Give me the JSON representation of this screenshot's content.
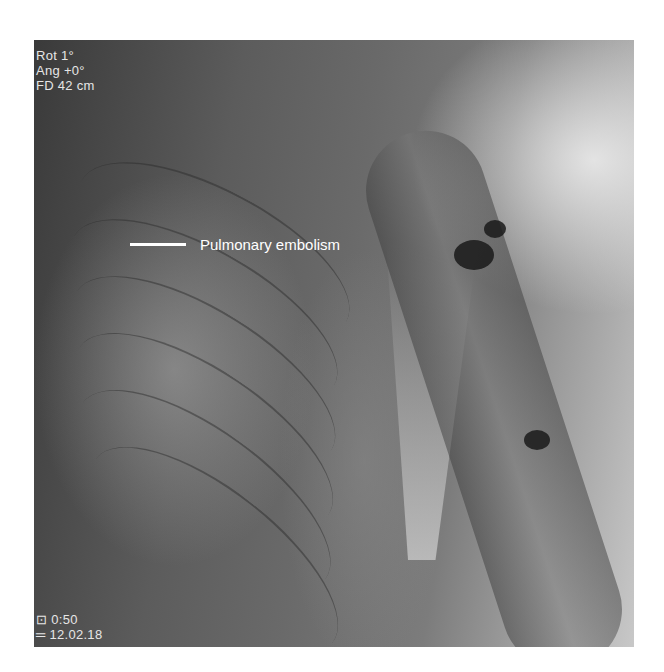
{
  "image": {
    "type": "fluoroscopy-angiogram",
    "region": "right chest and shoulder"
  },
  "overlay_top_left": {
    "rot": "Rot   1°",
    "ang": "Ang  +0°",
    "fd": "FD 42 cm"
  },
  "overlay_bottom_left": {
    "line1": "⊡ 0:50",
    "line2": "═ 12.02.18"
  },
  "annotation": {
    "label": "Pulmonary embolism"
  },
  "colors": {
    "annotation": "#ffffff",
    "overlay_text": "#e6e6e6"
  }
}
